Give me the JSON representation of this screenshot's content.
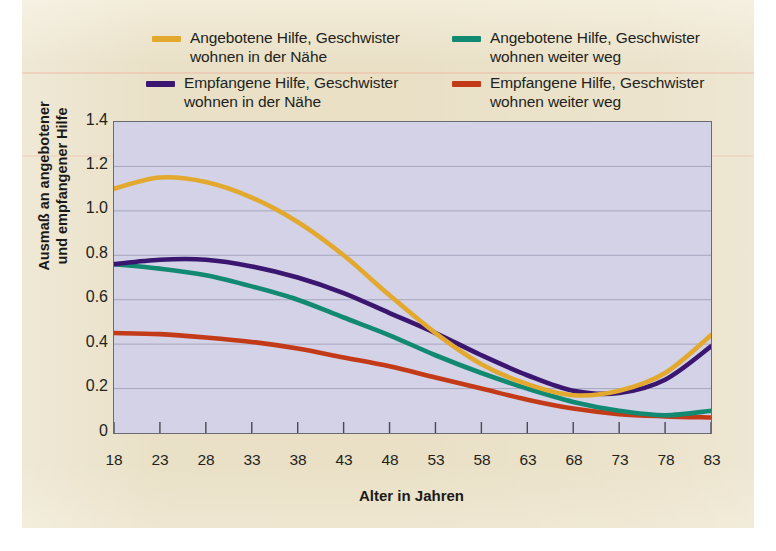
{
  "figure": {
    "background_color": "#e9e0c6",
    "plot_background_color": "#d3d2e6"
  },
  "legend": {
    "items": [
      {
        "label": "Angebotene Hilfe, Geschwister\nwohnen in der Nähe",
        "color": "#e2a92e",
        "name": "offered-help-siblings-near"
      },
      {
        "label": "Angebotene Hilfe, Geschwister\nwohnen weiter weg",
        "color": "#128a72",
        "name": "offered-help-siblings-far"
      },
      {
        "label": "Empfangene Hilfe, Geschwister\nwohnen in der Nähe",
        "color": "#3b1670",
        "name": "received-help-siblings-near"
      },
      {
        "label": "Empfangene Hilfe, Geschwister\nwohnen weiter weg",
        "color": "#c33a18",
        "name": "received-help-siblings-far"
      }
    ]
  },
  "axes": {
    "y_title": "Ausmaß an angebotener\nund empfangener Hilfe",
    "x_title": "Alter in Jahren",
    "y_ticks": [
      "0",
      "0.2",
      "0.4",
      "0.6",
      "0.8",
      "1.0",
      "1.2",
      "1.4"
    ],
    "x_ticks": [
      "18",
      "23",
      "28",
      "33",
      "38",
      "43",
      "48",
      "53",
      "58",
      "63",
      "68",
      "73",
      "78",
      "83"
    ]
  },
  "chart_data": {
    "type": "line",
    "title": "",
    "xlabel": "Alter in Jahren",
    "ylabel": "Ausmaß an angebotener und empfangener Hilfe",
    "xlim": [
      18,
      83
    ],
    "ylim": [
      0,
      1.4
    ],
    "grid": true,
    "legend_position": "top",
    "x": [
      18,
      23,
      28,
      33,
      38,
      43,
      48,
      53,
      58,
      63,
      68,
      73,
      78,
      83
    ],
    "series": [
      {
        "name": "Angebotene Hilfe, Geschwister wohnen in der Nähe",
        "color": "#e2a92e",
        "values": [
          1.1,
          1.15,
          1.13,
          1.06,
          0.95,
          0.8,
          0.62,
          0.45,
          0.31,
          0.22,
          0.17,
          0.19,
          0.27,
          0.44
        ]
      },
      {
        "name": "Angebotene Hilfe, Geschwister wohnen weiter weg",
        "color": "#128a72",
        "values": [
          0.76,
          0.74,
          0.71,
          0.66,
          0.6,
          0.52,
          0.44,
          0.35,
          0.27,
          0.2,
          0.14,
          0.1,
          0.08,
          0.1
        ]
      },
      {
        "name": "Empfangene Hilfe, Geschwister wohnen in der Nähe",
        "color": "#3b1670",
        "values": [
          0.76,
          0.78,
          0.78,
          0.75,
          0.7,
          0.63,
          0.54,
          0.45,
          0.35,
          0.26,
          0.19,
          0.18,
          0.24,
          0.39
        ]
      },
      {
        "name": "Empfangene Hilfe, Geschwister wohnen weiter weg",
        "color": "#c33a18",
        "values": [
          0.45,
          0.445,
          0.43,
          0.41,
          0.38,
          0.34,
          0.3,
          0.25,
          0.2,
          0.15,
          0.11,
          0.085,
          0.075,
          0.07
        ]
      }
    ]
  }
}
